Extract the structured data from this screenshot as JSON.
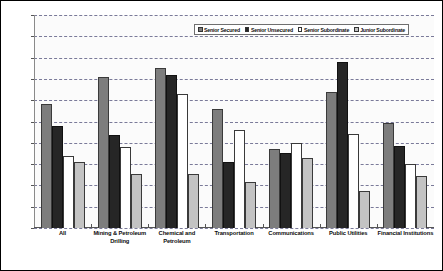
{
  "chart_data": {
    "type": "bar",
    "title": "",
    "xlabel": "",
    "ylabel": "",
    "ylim": [
      0,
      100
    ],
    "grid": true,
    "legend_position": "top-center",
    "ytick_labels": [
      "0%",
      "10%",
      "20%",
      "30%",
      "40%",
      "50%",
      "60%",
      "70%",
      "80%",
      "90%",
      "100%"
    ],
    "ytick_values": [
      0,
      10,
      20,
      30,
      40,
      50,
      60,
      70,
      80,
      90,
      100
    ],
    "categories": [
      "All",
      "Mining & Petroleum Drilling",
      "Chemical and Petroleum",
      "Transportation",
      "Communications",
      "Public Utilities",
      "Financial Institutions"
    ],
    "series": [
      {
        "name": "Senior Secured",
        "color": "#7d7d7d",
        "values": [
          58,
          71,
          75,
          56,
          37,
          64,
          49.5
        ]
      },
      {
        "name": "Senior Unsecured",
        "color": "#262626",
        "values": [
          48,
          43.5,
          72,
          31,
          35,
          78,
          38.5
        ]
      },
      {
        "name": "Senior Subordinate",
        "color": "#ffffff",
        "values": [
          34,
          38,
          63,
          46,
          40,
          44,
          30
        ]
      },
      {
        "name": "Junior Subordinate",
        "color": "#c3c3c3",
        "values": [
          31,
          25.5,
          25.5,
          21.5,
          33,
          17.5,
          24.5
        ]
      }
    ]
  }
}
